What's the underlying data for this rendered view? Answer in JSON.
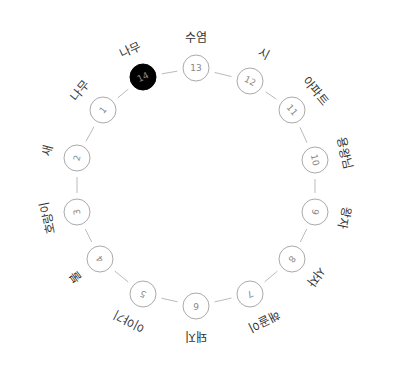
{
  "diagram": {
    "type": "circular-sequence",
    "center": [
      196,
      188
    ],
    "radius": 118,
    "node_radius": 13,
    "colors": {
      "ring": "#aaaaaa",
      "connector": "#bbbbbb",
      "node_text": "#888888",
      "label": "#333333",
      "active_fill": "#000000",
      "active_text": "#ffffff"
    },
    "nodes": [
      {
        "number": "1",
        "label": "나무",
        "x": 103,
        "y": 110
      },
      {
        "number": "2",
        "label": "새",
        "x": 77,
        "y": 158
      },
      {
        "number": "3",
        "label": "호랑이",
        "x": 77,
        "y": 212
      },
      {
        "number": "4",
        "label": "불",
        "x": 100,
        "y": 259
      },
      {
        "number": "5",
        "label": "이야기",
        "x": 143,
        "y": 294
      },
      {
        "number": "6",
        "label": "돼지",
        "x": 196,
        "y": 306
      },
      {
        "number": "7",
        "label": "해골이",
        "x": 250,
        "y": 294
      },
      {
        "number": "8",
        "label": "사자",
        "x": 292,
        "y": 259
      },
      {
        "number": "9",
        "label": "왕자",
        "x": 315,
        "y": 212
      },
      {
        "number": "10",
        "label": "용왕님",
        "x": 315,
        "y": 160
      },
      {
        "number": "11",
        "label": "아파트",
        "x": 292,
        "y": 110
      },
      {
        "number": "12",
        "label": "시",
        "x": 250,
        "y": 81
      },
      {
        "number": "13",
        "label": "수염",
        "x": 196,
        "y": 68
      },
      {
        "number": "14",
        "label": "나무",
        "x": 143,
        "y": 77,
        "active": true
      }
    ]
  }
}
